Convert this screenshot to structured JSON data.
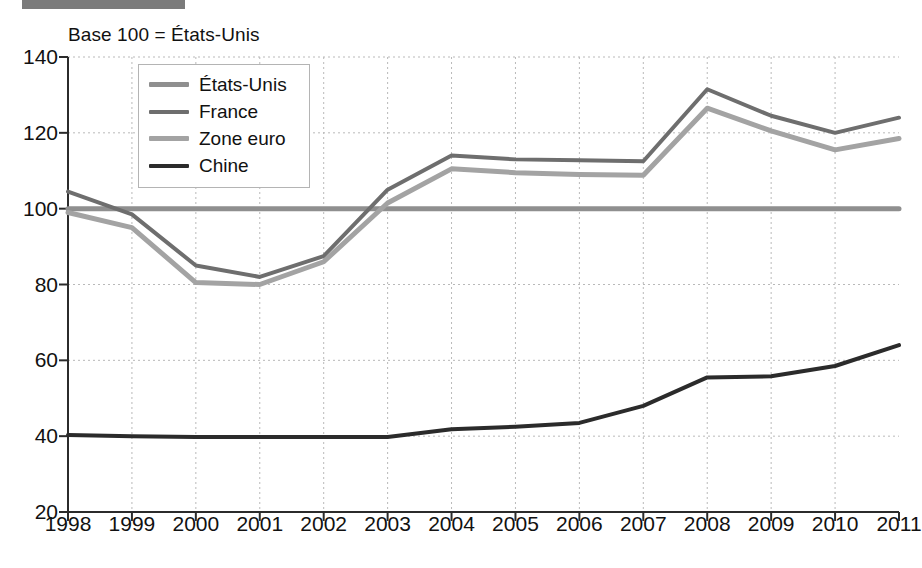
{
  "header": {
    "bar_label": "header-bar"
  },
  "chart_data": {
    "type": "line",
    "title": "",
    "subtitle": "Base 100 = États-Unis",
    "xlabel": "",
    "ylabel": "",
    "categories": [
      "1998",
      "1999",
      "2000",
      "2001",
      "2002",
      "2003",
      "2004",
      "2005",
      "2006",
      "2007",
      "2008",
      "2009",
      "2010",
      "2011"
    ],
    "xlim": [
      1998,
      2011
    ],
    "ylim": [
      20,
      140
    ],
    "yticks": [
      20,
      40,
      60,
      80,
      100,
      120,
      140
    ],
    "grid": true,
    "grid_style": "dotted",
    "legend_position": "top-left-inside",
    "series": [
      {
        "name": "États-Unis",
        "color": "#8f8f8f",
        "width": 5,
        "values": [
          100,
          100,
          100,
          100,
          100,
          100,
          100,
          100,
          100,
          100,
          100,
          100,
          100,
          100
        ]
      },
      {
        "name": "France",
        "color": "#6e6e6e",
        "width": 4,
        "values": [
          104.5,
          98.5,
          85.0,
          82.0,
          87.5,
          105.0,
          114.0,
          113.0,
          112.8,
          112.5,
          131.5,
          124.5,
          120.0,
          124.0
        ]
      },
      {
        "name": "Zone euro",
        "color": "#a3a3a3",
        "width": 5,
        "values": [
          99.0,
          95.0,
          80.5,
          80.0,
          86.0,
          101.5,
          110.5,
          109.5,
          109.0,
          108.8,
          126.5,
          120.5,
          115.5,
          118.5
        ]
      },
      {
        "name": "Chine",
        "color": "#2b2b2b",
        "width": 4,
        "values": [
          40.3,
          40.0,
          39.8,
          39.8,
          39.8,
          39.8,
          41.8,
          42.5,
          43.5,
          48.0,
          55.5,
          55.8,
          58.5,
          64.0
        ]
      }
    ]
  }
}
